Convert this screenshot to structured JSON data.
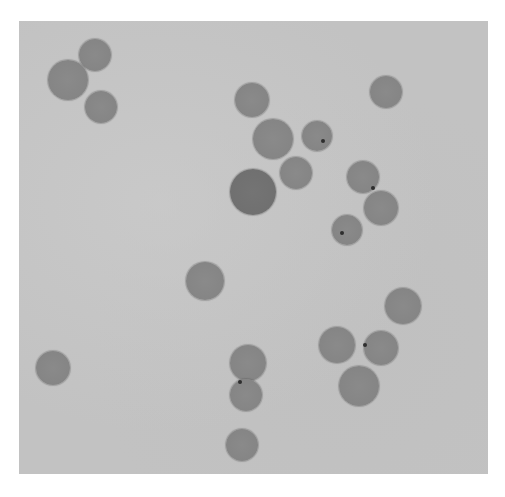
{
  "image": {
    "description": "Grayscale brightfield micrograph of round cells on a light gray background",
    "background_color": "#c2c2c2",
    "cell_color": "#858585",
    "cell_count": 21,
    "cells": [
      {
        "cx": 95,
        "cy": 55,
        "r": 16
      },
      {
        "cx": 68,
        "cy": 80,
        "r": 20
      },
      {
        "cx": 101,
        "cy": 107,
        "r": 16
      },
      {
        "cx": 252,
        "cy": 100,
        "r": 17
      },
      {
        "cx": 386,
        "cy": 92,
        "r": 16
      },
      {
        "cx": 273,
        "cy": 139,
        "r": 20
      },
      {
        "cx": 317,
        "cy": 136,
        "r": 15,
        "spots": [
          [
            6,
            5
          ]
        ]
      },
      {
        "cx": 296,
        "cy": 173,
        "r": 16
      },
      {
        "cx": 253,
        "cy": 192,
        "r": 23,
        "dark": true
      },
      {
        "cx": 363,
        "cy": 177,
        "r": 16,
        "spots": [
          [
            10,
            11
          ]
        ]
      },
      {
        "cx": 381,
        "cy": 208,
        "r": 17
      },
      {
        "cx": 347,
        "cy": 230,
        "r": 15,
        "spots": [
          [
            -5,
            3
          ]
        ]
      },
      {
        "cx": 205,
        "cy": 281,
        "r": 19
      },
      {
        "cx": 403,
        "cy": 306,
        "r": 18
      },
      {
        "cx": 53,
        "cy": 368,
        "r": 17
      },
      {
        "cx": 337,
        "cy": 345,
        "r": 18
      },
      {
        "cx": 381,
        "cy": 348,
        "r": 17,
        "spots": [
          [
            -16,
            -3
          ]
        ]
      },
      {
        "cx": 248,
        "cy": 363,
        "r": 18
      },
      {
        "cx": 246,
        "cy": 395,
        "r": 16,
        "spots": [
          [
            -6,
            -13
          ]
        ]
      },
      {
        "cx": 359,
        "cy": 386,
        "r": 20
      },
      {
        "cx": 242,
        "cy": 445,
        "r": 16
      }
    ]
  }
}
